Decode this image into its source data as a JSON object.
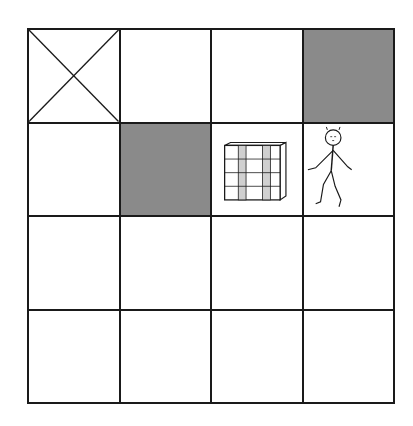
{
  "grid": {
    "rows": 4,
    "cols": 4,
    "cells": [
      {
        "row": 0,
        "col": 0,
        "type": "blocked-x"
      },
      {
        "row": 0,
        "col": 1,
        "type": "empty"
      },
      {
        "row": 0,
        "col": 2,
        "type": "empty"
      },
      {
        "row": 0,
        "col": 3,
        "type": "shaded"
      },
      {
        "row": 1,
        "col": 0,
        "type": "empty"
      },
      {
        "row": 1,
        "col": 1,
        "type": "shaded"
      },
      {
        "row": 1,
        "col": 2,
        "type": "box"
      },
      {
        "row": 1,
        "col": 3,
        "type": "person"
      },
      {
        "row": 2,
        "col": 0,
        "type": "empty"
      },
      {
        "row": 2,
        "col": 1,
        "type": "empty"
      },
      {
        "row": 2,
        "col": 2,
        "type": "empty"
      },
      {
        "row": 2,
        "col": 3,
        "type": "empty"
      },
      {
        "row": 3,
        "col": 0,
        "type": "empty"
      },
      {
        "row": 3,
        "col": 1,
        "type": "empty"
      },
      {
        "row": 3,
        "col": 2,
        "type": "empty"
      },
      {
        "row": 3,
        "col": 3,
        "type": "empty"
      }
    ]
  },
  "colors": {
    "line": "#1a1a1a",
    "shaded": "#8a8a8a",
    "box_stripe": "#d0d0d0"
  },
  "icons": {
    "blocked": "x-mark-icon",
    "box": "crate-icon",
    "agent": "stick-figure-icon"
  }
}
